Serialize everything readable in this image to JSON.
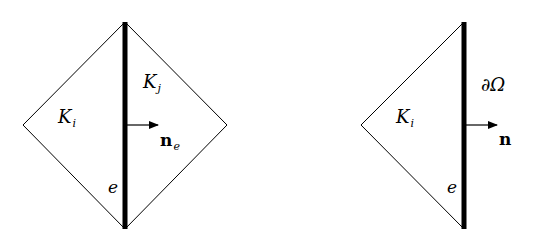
{
  "figure": {
    "left_panel": {
      "element_left_label": "K",
      "element_left_sub": "i",
      "element_right_label": "K",
      "element_right_sub": "j",
      "normal_label": "n",
      "normal_sub": "e",
      "edge_label": "e"
    },
    "right_panel": {
      "element_label": "K",
      "element_sub": "i",
      "boundary_label": "∂Ω",
      "normal_label": "n",
      "edge_label": "e"
    },
    "colors": {
      "stroke": "#000000",
      "background": "#ffffff"
    }
  }
}
